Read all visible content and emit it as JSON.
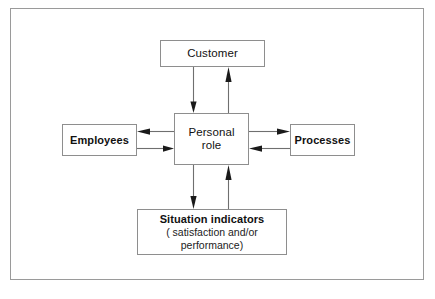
{
  "diagram": {
    "title_text": "Personal role relationship diagram",
    "frame": {
      "border_color": "#9a9a9a"
    },
    "nodes": {
      "customer": {
        "label": "Customer"
      },
      "personal_role": {
        "label_line1": "Personal",
        "label_line2": "role"
      },
      "employees": {
        "label": "Employees"
      },
      "processes": {
        "label": "Processes"
      },
      "situation_indicators": {
        "label": "Situation indicators",
        "sub_line1": "( satisfaction and/or",
        "sub_line2": "performance)"
      }
    },
    "connectors": [
      {
        "name": "customer-to-personal-role",
        "from": "customer",
        "to": "personal_role",
        "direction": "down"
      },
      {
        "name": "personal-role-to-customer",
        "from": "personal_role",
        "to": "customer",
        "direction": "up"
      },
      {
        "name": "personal-role-to-employees",
        "from": "personal_role",
        "to": "employees",
        "direction": "left"
      },
      {
        "name": "employees-to-personal-role",
        "from": "employees",
        "to": "personal_role",
        "direction": "right"
      },
      {
        "name": "personal-role-to-processes",
        "from": "personal_role",
        "to": "processes",
        "direction": "right"
      },
      {
        "name": "processes-to-personal-role",
        "from": "processes",
        "to": "personal_role",
        "direction": "left"
      },
      {
        "name": "personal-role-to-situation-indicators",
        "from": "personal_role",
        "to": "situation_indicators",
        "direction": "down"
      },
      {
        "name": "situation-indicators-to-personal-role",
        "from": "situation_indicators",
        "to": "personal_role",
        "direction": "up"
      }
    ],
    "colors": {
      "box_border": "#8e8e8e",
      "line": "#6f6f6f",
      "arrowhead": "#1a1a1a",
      "text": "#111111",
      "background": "#ffffff"
    }
  }
}
